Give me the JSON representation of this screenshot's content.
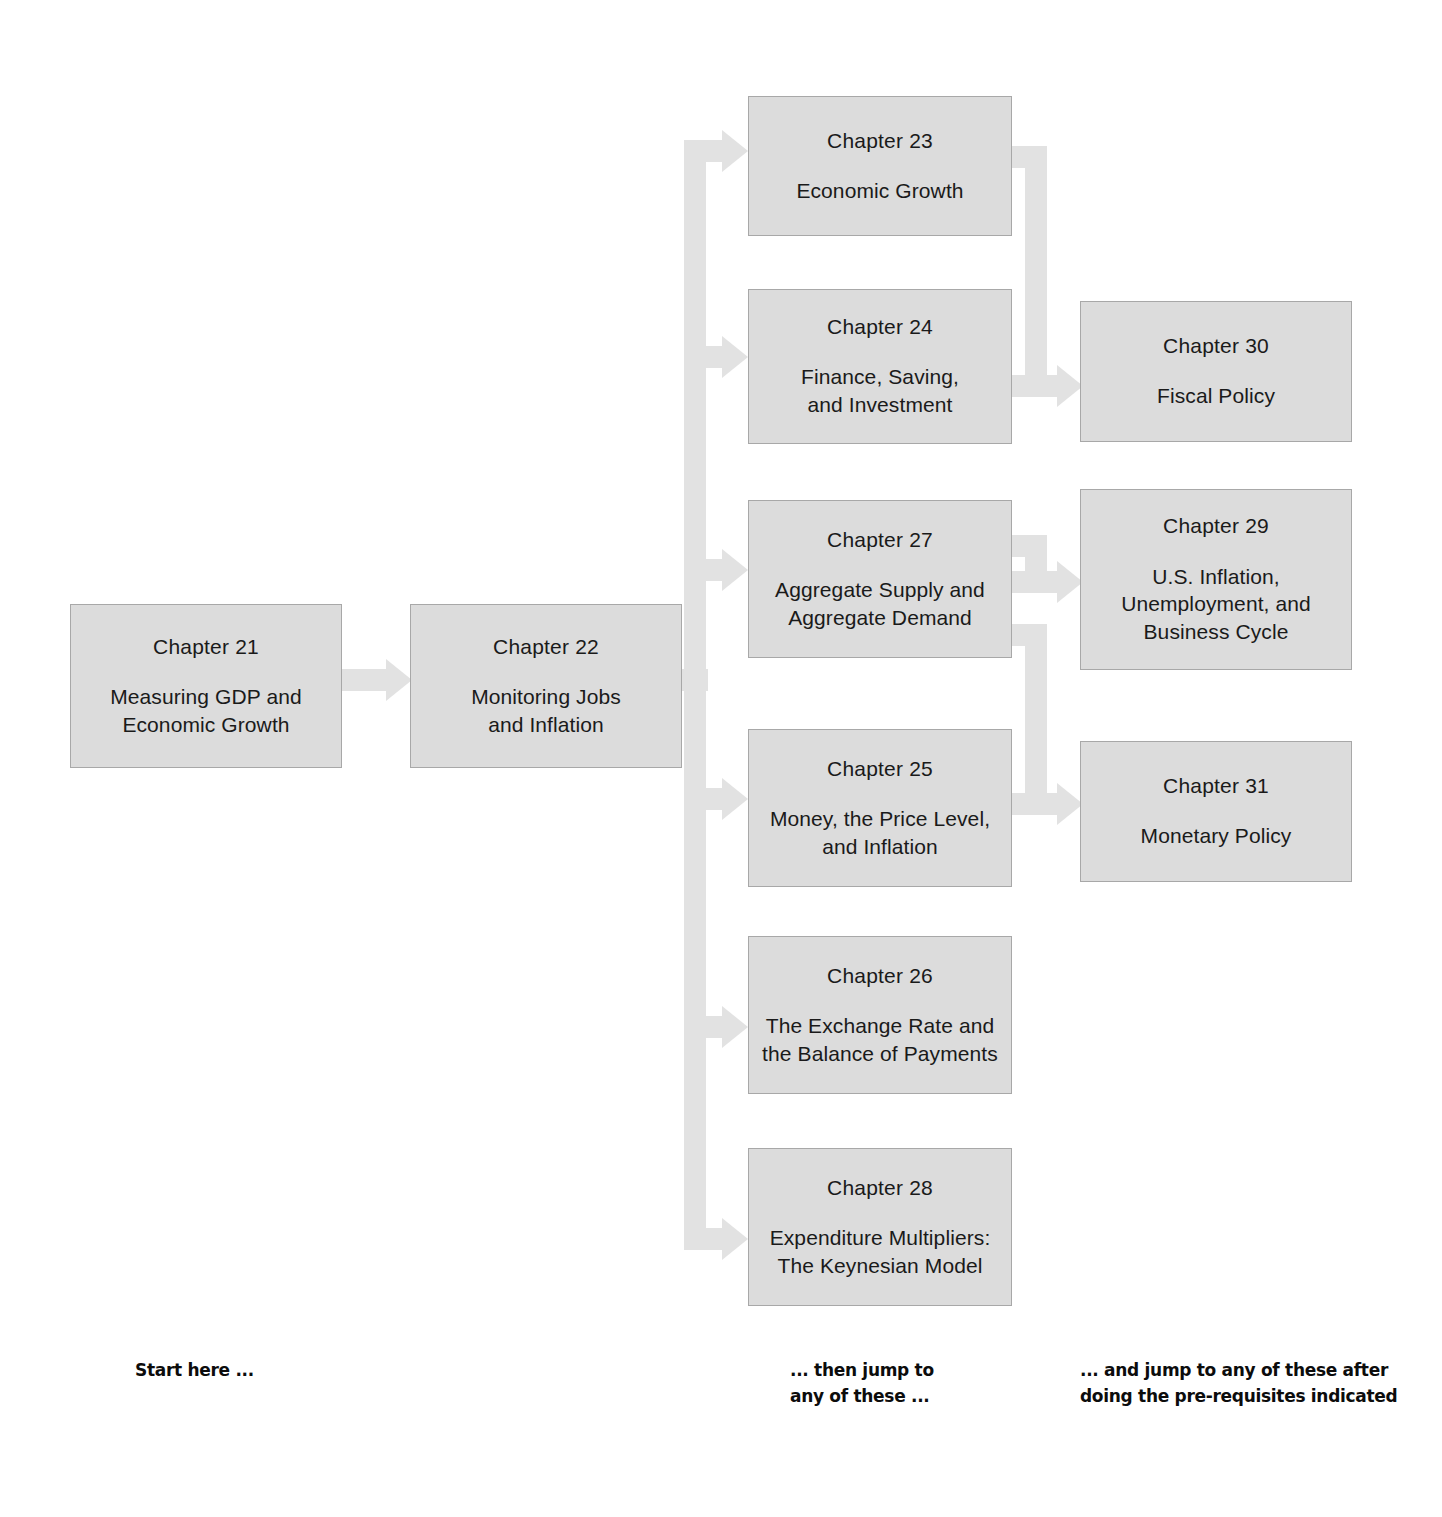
{
  "diagram": {
    "box_fill_color": "#dcdcdc",
    "box_border_color": "#a8a8a8",
    "connector_color": "#e2e2e2",
    "text_color": "#1a1a1a"
  },
  "columns": {
    "start": {
      "caption": "Start here ..."
    },
    "middle": {
      "caption": "... then jump to\nany of these ..."
    },
    "right": {
      "caption": "... and jump to any of these after\ndoing the pre-requisites indicated"
    }
  },
  "boxes": [
    {
      "id": "ch21",
      "number": "Chapter 21",
      "title": "Measuring GDP and\nEconomic Growth"
    },
    {
      "id": "ch22",
      "number": "Chapter 22",
      "title": "Monitoring Jobs\nand Inflation"
    },
    {
      "id": "ch23",
      "number": "Chapter 23",
      "title": "Economic Growth"
    },
    {
      "id": "ch24",
      "number": "Chapter 24",
      "title": "Finance, Saving,\nand Investment"
    },
    {
      "id": "ch27",
      "number": "Chapter 27",
      "title": "Aggregate Supply and\nAggregate Demand"
    },
    {
      "id": "ch25",
      "number": "Chapter 25",
      "title": "Money, the Price Level,\nand Inflation"
    },
    {
      "id": "ch26",
      "number": "Chapter 26",
      "title": "The Exchange Rate and\nthe Balance of Payments"
    },
    {
      "id": "ch28",
      "number": "Chapter 28",
      "title": "Expenditure Multipliers:\nThe Keynesian Model"
    },
    {
      "id": "ch30",
      "number": "Chapter 30",
      "title": "Fiscal Policy"
    },
    {
      "id": "ch29",
      "number": "Chapter 29",
      "title": "U.S. Inflation,\nUnemployment, and\nBusiness Cycle"
    },
    {
      "id": "ch31",
      "number": "Chapter 31",
      "title": "Monetary Policy"
    }
  ]
}
